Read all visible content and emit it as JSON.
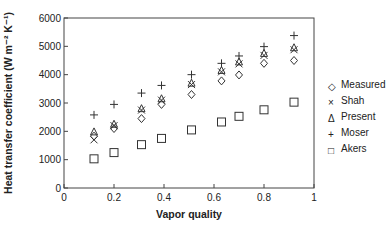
{
  "chart_data": {
    "type": "scatter",
    "title": "",
    "xlabel": "Vapor quality",
    "ylabel": "Heat transfer coefficient (W m⁻² K⁻¹)",
    "xlim": [
      0,
      1
    ],
    "ylim": [
      0,
      6000
    ],
    "xticks": [
      "0",
      "0.2",
      "0.4",
      "0.6",
      "0.8",
      "1"
    ],
    "yticks": [
      "0",
      "1000",
      "2000",
      "3000",
      "4000",
      "5000",
      "6000"
    ],
    "grid": false,
    "legend_position": "right",
    "x": [
      0.12,
      0.2,
      0.31,
      0.39,
      0.51,
      0.63,
      0.7,
      0.8,
      0.92
    ],
    "series": [
      {
        "name": "Measured",
        "marker": "diamond",
        "values": [
          1830,
          2100,
          2450,
          2950,
          3300,
          3780,
          3990,
          4400,
          4500
        ]
      },
      {
        "name": "Shah",
        "marker": "x",
        "values": [
          1700,
          2200,
          2750,
          3100,
          3650,
          4100,
          4380,
          4680,
          4880
        ]
      },
      {
        "name": "Present",
        "marker": "triangle",
        "values": [
          1980,
          2250,
          2800,
          3150,
          3700,
          4150,
          4450,
          4750,
          4950
        ]
      },
      {
        "name": "Moser",
        "marker": "plus",
        "values": [
          2580,
          2950,
          3350,
          3620,
          4000,
          4400,
          4660,
          4990,
          5380
        ]
      },
      {
        "name": "Akers",
        "marker": "square",
        "values": [
          1030,
          1250,
          1530,
          1750,
          2050,
          2330,
          2530,
          2760,
          3030
        ]
      }
    ]
  },
  "legend": {
    "items": [
      {
        "label": "Measured",
        "glyph": "◇"
      },
      {
        "label": "Shah",
        "glyph": "×"
      },
      {
        "label": "Present",
        "glyph": "Δ"
      },
      {
        "label": "Moser",
        "glyph": "+"
      },
      {
        "label": "Akers",
        "glyph": "□"
      }
    ]
  }
}
